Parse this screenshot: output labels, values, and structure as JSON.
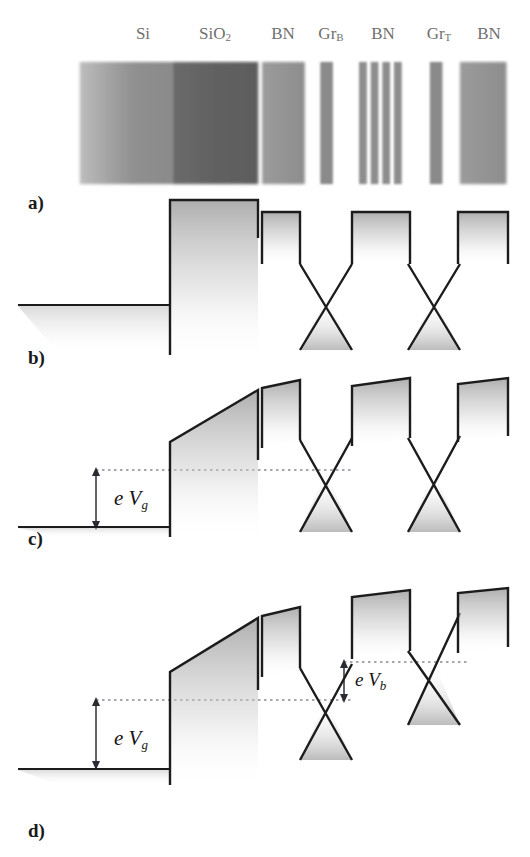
{
  "figure": {
    "type": "band-diagram-schematic",
    "width": 530,
    "height": 857,
    "background": "#ffffff",
    "ink": "#1c1c1c"
  },
  "panels": [
    {
      "id": "a",
      "label": "a)",
      "label_x": 28,
      "label_y": 192,
      "caption_meaning": "layer stack cross-section"
    },
    {
      "id": "b",
      "label": "b)",
      "label_x": 28,
      "label_y": 347,
      "caption_meaning": "flat band, zero bias"
    },
    {
      "id": "c",
      "label": "c)",
      "label_x": 28,
      "label_y": 528,
      "caption_meaning": "gate voltage applied"
    },
    {
      "id": "d",
      "label": "d)",
      "label_x": 28,
      "label_y": 820,
      "caption_meaning": "gate and bias voltage applied"
    }
  ],
  "stack": {
    "labels": [
      {
        "text": "Si",
        "sub": "",
        "x": 143,
        "color": "#6f6f6f"
      },
      {
        "text": "SiO",
        "sub": "2",
        "x": 215,
        "color": "#6f6f6f"
      },
      {
        "text": "BN",
        "sub": "",
        "x": 283,
        "color": "#6f6f6f"
      },
      {
        "text": "Gr",
        "sub": "B",
        "x": 331,
        "color": "#6f6f6f"
      },
      {
        "text": "BN",
        "sub": "",
        "x": 383,
        "color": "#6f6f6f"
      },
      {
        "text": "Gr",
        "sub": "T",
        "x": 439,
        "color": "#6f6f6f"
      },
      {
        "text": "BN",
        "sub": "",
        "x": 489,
        "color": "#6f6f6f"
      }
    ],
    "slabs": [
      {
        "name": "si",
        "x": 74,
        "w": 96,
        "fill": "si-grad"
      },
      {
        "name": "sio2",
        "x": 170,
        "w": 88,
        "fill": "#6e6e6e"
      },
      {
        "name": "bn-bot",
        "x": 262,
        "w": 44,
        "fill": "#909090"
      },
      {
        "name": "gr-b",
        "x": 322,
        "w": 13,
        "fill": "#8a8a8a"
      },
      {
        "name": "bn-m-1",
        "x": 362,
        "w": 8,
        "fill": "#8d8d8d"
      },
      {
        "name": "bn-m-2",
        "x": 374,
        "w": 8,
        "fill": "#8d8d8d"
      },
      {
        "name": "bn-m-3",
        "x": 386,
        "w": 8,
        "fill": "#8d8d8d"
      },
      {
        "name": "bn-m-4",
        "x": 398,
        "w": 8,
        "fill": "#8d8d8d"
      },
      {
        "name": "gr-t",
        "x": 435,
        "w": 13,
        "fill": "#8a8a8a"
      },
      {
        "name": "bn-top",
        "x": 466,
        "w": 48,
        "fill": "#8f8f8f"
      }
    ]
  },
  "band_diagrams": {
    "b": {
      "top": 195,
      "height": 155,
      "fermi_left_y": 300,
      "si_flat": true,
      "barriers": [
        {
          "name": "sio2-barrier",
          "x1": 170,
          "x2": 258,
          "top": 200,
          "bottom": 235,
          "tilt": 0
        },
        {
          "name": "bn-bottom-barrier",
          "x1": 262,
          "x2": 300,
          "top": 212,
          "bottom": 262,
          "tilt": 0
        },
        {
          "name": "bn-middle-barrier",
          "x1": 352,
          "x2": 410,
          "top": 212,
          "bottom": 262,
          "tilt": 0
        },
        {
          "name": "bn-top-barrier",
          "x1": 458,
          "x2": 508,
          "top": 212,
          "bottom": 262,
          "tilt": 0
        }
      ],
      "dirac_cones": [
        {
          "name": "graphene-bottom-cone",
          "apex_x": 326,
          "apex_y": 298,
          "half_width": 30,
          "half_height": 80
        },
        {
          "name": "graphene-top-cone",
          "apex_x": 434,
          "apex_y": 298,
          "half_width": 30,
          "half_height": 80
        }
      ]
    },
    "c": {
      "top": 372,
      "height": 160,
      "fermi_dotted_y": 470,
      "si_level_y": 527,
      "gate_arrow": {
        "x": 96,
        "y_top": 470,
        "y_bottom": 527
      },
      "gate_label": {
        "text_e": "e",
        "text_V": "V",
        "sub": "g",
        "x": 118,
        "y": 500
      },
      "barriers": [
        {
          "name": "sio2-barrier",
          "x1": 170,
          "x2": 258,
          "top_left": 442,
          "top_right": 390,
          "tilted": true
        },
        {
          "name": "bn-bottom-barrier",
          "x1": 262,
          "x2": 300,
          "top": 382,
          "bottom": 440,
          "tilted": true
        },
        {
          "name": "bn-middle-barrier",
          "x1": 352,
          "x2": 410,
          "top": 378,
          "bottom": 438,
          "tilted": true
        },
        {
          "name": "bn-top-barrier",
          "x1": 458,
          "x2": 508,
          "top": 380,
          "bottom": 438,
          "tilted": true
        }
      ],
      "dirac_cones": [
        {
          "name": "graphene-bottom-cone",
          "apex_x": 326,
          "apex_y": 470,
          "half_width": 30,
          "half_height": 80
        },
        {
          "name": "graphene-top-cone",
          "apex_x": 434,
          "apex_y": 470,
          "half_width": 30,
          "half_height": 80
        }
      ]
    },
    "d": {
      "top": 590,
      "height": 180,
      "fermi_dotted_y_left": 700,
      "fermi_dotted_y_right": 662,
      "si_level_y": 769,
      "gate_arrow": {
        "x": 96,
        "y_top": 700,
        "y_bottom": 769
      },
      "gate_label": {
        "text_e": "e",
        "text_V": "V",
        "sub": "g",
        "x": 118,
        "y": 740
      },
      "bias_arrow": {
        "x": 344,
        "y_top": 662,
        "y_bottom": 700
      },
      "bias_label": {
        "text_e": "e",
        "text_V": "V",
        "sub": "b",
        "x": 356,
        "y": 683
      },
      "barriers": [
        {
          "name": "sio2-barrier",
          "x1": 170,
          "x2": 258,
          "top_left": 672,
          "top_right": 618,
          "tilted": true
        },
        {
          "name": "bn-bottom-barrier",
          "x1": 262,
          "x2": 300,
          "top": 610,
          "bottom": 668,
          "tilted": true
        },
        {
          "name": "bn-middle-barrier",
          "x1": 352,
          "x2": 410,
          "top": 592,
          "bottom": 652,
          "tilted": true
        },
        {
          "name": "bn-top-barrier",
          "x1": 458,
          "x2": 508,
          "top": 592,
          "bottom": 650,
          "tilted": true
        }
      ],
      "dirac_cones": [
        {
          "name": "graphene-bottom-cone",
          "apex_x": 326,
          "apex_y": 700,
          "half_width": 30,
          "half_height": 80
        },
        {
          "name": "graphene-top-cone",
          "apex_x": 434,
          "apex_y": 662,
          "half_width": 30,
          "half_height": 80
        }
      ]
    }
  }
}
